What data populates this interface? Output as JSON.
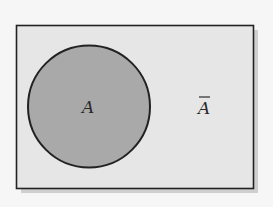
{
  "diagram": {
    "type": "venn",
    "universe": {
      "fill": "#e6e6e6",
      "stroke": "#222222",
      "shadow": "#c8c8c8"
    },
    "sets": [
      {
        "name": "A",
        "label": "A",
        "fill": "#a9a9a9",
        "stroke": "#222222"
      }
    ],
    "complement": {
      "label": "A",
      "overline": true,
      "meaning": "complement of A"
    }
  }
}
